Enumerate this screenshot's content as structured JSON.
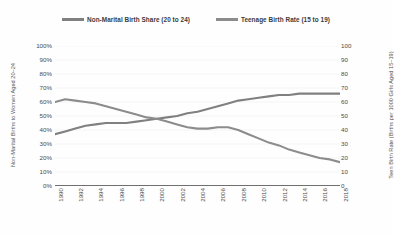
{
  "chart_data": {
    "type": "line",
    "title": "",
    "subtitle": "",
    "xlabel": "",
    "ylabel": "Non-Marital Births to Women Aged 20–24",
    "y2label": "Teen Birth Rate (Births per 1000 Girls Aged 15–19)",
    "grid": true,
    "legend_position": "top",
    "legend": [
      "Non-Marital Birth Share (20 to 24)",
      "Teenage Birth Rate (15 to 19)"
    ],
    "x": [
      1990,
      1991,
      1992,
      1993,
      1994,
      1995,
      1996,
      1997,
      1998,
      1999,
      2000,
      2001,
      2002,
      2003,
      2004,
      2005,
      2006,
      2007,
      2008,
      2009,
      2010,
      2011,
      2012,
      2013,
      2014,
      2015,
      2016,
      2017,
      2018
    ],
    "xtick_labels": [
      "1990",
      "1992",
      "1994",
      "1996",
      "1998",
      "2000",
      "2002",
      "2004",
      "2006",
      "2008",
      "2010",
      "2012",
      "2014",
      "2016",
      "2018"
    ],
    "ylim": [
      0,
      100
    ],
    "ytick_labels": [
      "0%",
      "10%",
      "20%",
      "30%",
      "40%",
      "50%",
      "60%",
      "70%",
      "80%",
      "90%",
      "100%"
    ],
    "y2lim": [
      0,
      100
    ],
    "y2tick_labels": [
      "0",
      "10",
      "20",
      "30",
      "40",
      "50",
      "60",
      "70",
      "80",
      "90",
      "100"
    ],
    "series": [
      {
        "name": "Non-Marital Birth Share (20 to 24)",
        "axis": "left",
        "unit": "percent",
        "color": "#808080",
        "values": [
          37,
          39,
          41,
          43,
          44,
          45,
          45,
          45,
          46,
          47,
          48,
          49,
          50,
          52,
          53,
          55,
          57,
          59,
          61,
          62,
          63,
          64,
          65,
          65,
          66,
          66,
          66,
          66,
          66
        ]
      },
      {
        "name": "Teenage Birth Rate (15 to 19)",
        "axis": "right",
        "unit": "births per 1000",
        "color": "#8c8c8c",
        "values": [
          60,
          62,
          61,
          60,
          59,
          57,
          55,
          53,
          51,
          49,
          48,
          46,
          44,
          42,
          41,
          41,
          42,
          42,
          40,
          37,
          34,
          31,
          29,
          26,
          24,
          22,
          20,
          19,
          17
        ]
      }
    ]
  },
  "legend": {
    "items": [
      {
        "label": "Non-Marital Birth Share (20 to 24)",
        "color": "#808080"
      },
      {
        "label": "Teenage Birth Rate (15 to 19)",
        "color": "#8c8c8c"
      }
    ]
  },
  "axes": {
    "left_title": "Non-Marital Births to Women Aged 20–24",
    "right_title": "Teen Birth Rate (Births per 1000 Girls Aged 15–19)"
  }
}
